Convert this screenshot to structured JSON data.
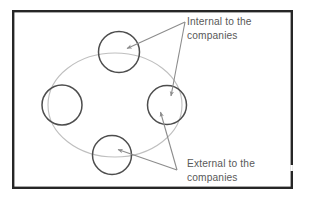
{
  "figure": {
    "frame": {
      "name": "slide-border",
      "color": "#262626",
      "x": 13,
      "y": 11,
      "width": 279,
      "height": 177,
      "stroke_width": 2.4
    },
    "background_color": "#ffffff",
    "ellipse": {
      "name": "process-cycle-ellipse",
      "color": "#bfbfbf",
      "cx": 115,
      "cy": 105,
      "rx": 67,
      "ry": 52,
      "stroke_width": 1.1
    },
    "circles": [
      {
        "id": "top",
        "label": "",
        "cx": 119,
        "cy": 52,
        "r": 20.5,
        "color": "#4d4d4d"
      },
      {
        "id": "left",
        "label": "",
        "cx": 62,
        "cy": 105,
        "r": 20.0,
        "color": "#4d4d4d"
      },
      {
        "id": "right",
        "label": "",
        "cx": 167,
        "cy": 105,
        "r": 19.5,
        "color": "#4d4d4d"
      },
      {
        "id": "bottom",
        "label": "",
        "cx": 112,
        "cy": 155,
        "r": 19.5,
        "color": "#4d4d4d"
      }
    ],
    "callouts": [
      {
        "id": "internal",
        "label_lines": [
          "Internal to the",
          "companies"
        ],
        "text_color": "#595959",
        "text_x": 187,
        "text_y": 25,
        "line_height": 14,
        "connector_color": "#8c8c8c",
        "apex_x": 185,
        "apex_y": 22,
        "targets": [
          {
            "id": "top-circle",
            "x": 121,
            "y": 50
          },
          {
            "id": "right-circle",
            "x": 171,
            "y": 99
          }
        ]
      },
      {
        "id": "external",
        "label_lines": [
          "External to the",
          "companies"
        ],
        "text_color": "#595959",
        "text_x": 187,
        "text_y": 167,
        "line_height": 14,
        "connector_color": "#8c8c8c",
        "apex_x": 177,
        "apex_y": 170,
        "targets": [
          {
            "id": "right-circle",
            "x": 160,
            "y": 110
          },
          {
            "id": "bottom-circle",
            "x": 113,
            "y": 148
          }
        ]
      }
    ]
  }
}
